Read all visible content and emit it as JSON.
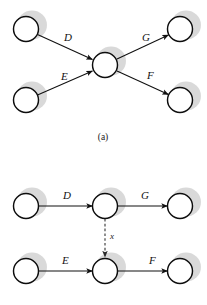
{
  "figure": {
    "caption_a": "(a)",
    "panels": [
      {
        "id": "panel-a",
        "layout": "converge-diverge",
        "nodes": [
          {
            "id": "a-n1",
            "cx": 26,
            "cy": 29
          },
          {
            "id": "a-n2",
            "cx": 26,
            "cy": 100
          },
          {
            "id": "a-n3",
            "cx": 105,
            "cy": 65
          },
          {
            "id": "a-n4",
            "cx": 180,
            "cy": 29
          },
          {
            "id": "a-n5",
            "cx": 180,
            "cy": 100
          }
        ],
        "edges": [
          {
            "id": "a-e-D",
            "label": "D",
            "from": "a-n1",
            "to": "a-n3",
            "style": "solid",
            "lx": 64,
            "ly": 41
          },
          {
            "id": "a-e-E",
            "label": "E",
            "from": "a-n2",
            "to": "a-n3",
            "style": "solid",
            "lx": 61,
            "ly": 80
          },
          {
            "id": "a-e-G",
            "label": "G",
            "from": "a-n3",
            "to": "a-n4",
            "style": "solid",
            "lx": 142,
            "ly": 41
          },
          {
            "id": "a-e-F",
            "label": "F",
            "from": "a-n3",
            "to": "a-n5",
            "style": "solid",
            "lx": 147,
            "ly": 79
          }
        ]
      },
      {
        "id": "panel-b",
        "layout": "two-chains-with-cross-link",
        "nodes": [
          {
            "id": "b-n1",
            "cx": 26,
            "cy": 206
          },
          {
            "id": "b-n2",
            "cx": 105,
            "cy": 206
          },
          {
            "id": "b-n3",
            "cx": 180,
            "cy": 206
          },
          {
            "id": "b-n4",
            "cx": 26,
            "cy": 271
          },
          {
            "id": "b-n5",
            "cx": 105,
            "cy": 271
          },
          {
            "id": "b-n6",
            "cx": 180,
            "cy": 271
          }
        ],
        "edges": [
          {
            "id": "b-e-D",
            "label": "D",
            "from": "b-n1",
            "to": "b-n2",
            "style": "solid",
            "lx": 63,
            "ly": 199
          },
          {
            "id": "b-e-G",
            "label": "G",
            "from": "b-n2",
            "to": "b-n3",
            "style": "solid",
            "lx": 141,
            "ly": 199
          },
          {
            "id": "b-e-E",
            "label": "E",
            "from": "b-n4",
            "to": "b-n5",
            "style": "solid",
            "lx": 62,
            "ly": 264
          },
          {
            "id": "b-e-F",
            "label": "F",
            "from": "b-n5",
            "to": "b-n6",
            "style": "solid",
            "lx": 149,
            "ly": 264
          },
          {
            "id": "b-e-x",
            "label": "x",
            "from": "b-n2",
            "to": "b-n5",
            "style": "dashed",
            "lx": 110,
            "ly": 239
          }
        ]
      }
    ],
    "style": {
      "node_radius": 12.5,
      "node_fill": "#ffffff",
      "node_stroke": "#0d0d0d",
      "shadow_color": "#b9b9b9",
      "line_color": "#101010",
      "background": "#ffffff"
    }
  }
}
